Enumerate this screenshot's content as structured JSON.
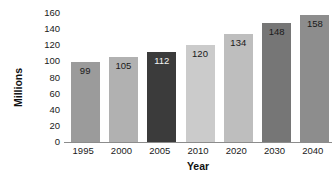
{
  "chart_data": {
    "type": "bar",
    "title": "",
    "xlabel": "Year",
    "ylabel": "Millions",
    "categories": [
      "1995",
      "2000",
      "2005",
      "2010",
      "2020",
      "2030",
      "2040"
    ],
    "values": [
      99,
      105,
      112,
      120,
      134,
      148,
      158
    ],
    "value_labels": [
      "99",
      "105",
      "112",
      "120",
      "134",
      "148",
      "158"
    ],
    "ylim": [
      0,
      160
    ],
    "yticks": [
      0,
      20,
      40,
      60,
      80,
      100,
      120,
      140,
      160
    ],
    "ytick_labels": [
      "0",
      "20",
      "40",
      "60",
      "80",
      "100",
      "120",
      "140",
      "160"
    ],
    "grid": false,
    "legend": "none",
    "bar_colors": [
      "#9b9b9b",
      "#b1b1b1",
      "#3b3b3b",
      "#cbcbcb",
      "#bebebe",
      "#767676",
      "#8d8d8d"
    ],
    "label_colors": [
      "#1a1a1a",
      "#1a1a1a",
      "#f2f2f2",
      "#1a1a1a",
      "#1a1a1a",
      "#1a1a1a",
      "#1a1a1a"
    ],
    "axis_color": "#8c8c8c",
    "background": "#ffffff"
  }
}
